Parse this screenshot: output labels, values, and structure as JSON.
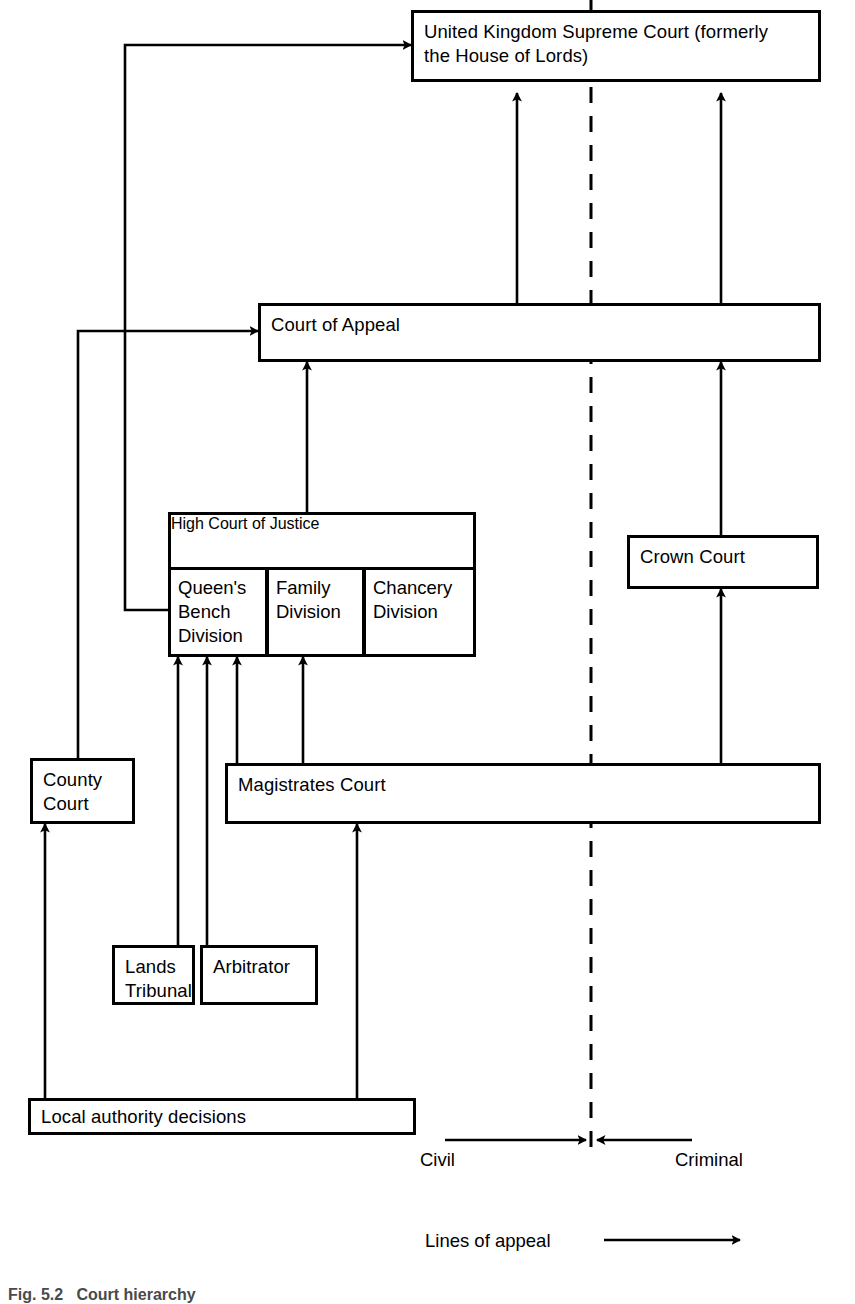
{
  "diagram": {
    "stroke_color": "#000000",
    "background_color": "#ffffff",
    "nodes": {
      "supreme_court": {
        "label": "United Kingdom Supreme Court (formerly\nthe House of Lords)"
      },
      "court_of_appeal": {
        "label": "Court of Appeal"
      },
      "high_court": {
        "label": "High Court of Justice"
      },
      "queens_bench": {
        "label": "Queen's\nBench\nDivision"
      },
      "family_division": {
        "label": "Family\nDivision"
      },
      "chancery_division": {
        "label": "Chancery\nDivision"
      },
      "crown_court": {
        "label": "Crown Court"
      },
      "county_court": {
        "label": "County\nCourt"
      },
      "magistrates_court": {
        "label": "Magistrates Court"
      },
      "lands_tribunal": {
        "label": "Lands\nTribunal"
      },
      "arbitrator": {
        "label": "Arbitrator"
      },
      "local_authority": {
        "label": "Local authority decisions"
      }
    },
    "jurisdiction_divider": {
      "left_label": "Civil",
      "right_label": "Criminal",
      "style": "dashed"
    },
    "legend": {
      "label": "Lines of appeal",
      "symbol": "arrow"
    },
    "figure_caption": "Fig. 5.2   Court hierarchy"
  }
}
